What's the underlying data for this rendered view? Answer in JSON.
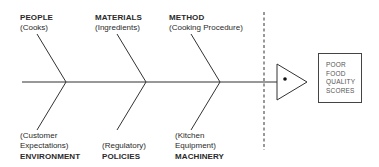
{
  "diagram": {
    "type": "fishbone",
    "effect": {
      "lines": [
        "POOR",
        "FOOD",
        "QUALITY",
        "SCORES"
      ]
    },
    "causes_top": [
      {
        "category": "PEOPLE",
        "detail": "(Cooks)"
      },
      {
        "category": "MATERIALS",
        "detail": "(Ingredients)"
      },
      {
        "category": "METHOD",
        "detail": "(Cooking Procedure)"
      }
    ],
    "causes_bottom": [
      {
        "category": "ENVIRONMENT",
        "detail_lines": [
          "(Customer",
          "Expectations)"
        ]
      },
      {
        "category": "POLICIES",
        "detail_lines": [
          "(Regulatory)"
        ]
      },
      {
        "category": "MACHINERY",
        "detail_lines": [
          "(Kitchen",
          "Equipment)"
        ]
      }
    ]
  }
}
